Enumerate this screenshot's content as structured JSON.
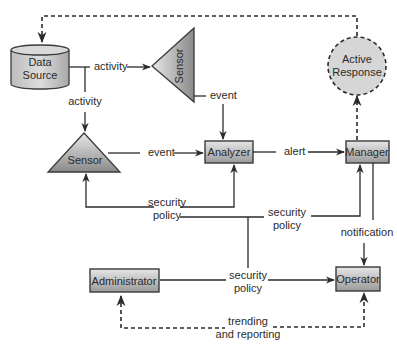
{
  "diagram": {
    "nodes": {
      "data_source": {
        "label_line1": "Data",
        "label_line2": "Source",
        "shape": "cylinder"
      },
      "sensor_top": {
        "label": "Sensor",
        "shape": "triangle-left"
      },
      "sensor_mid": {
        "label": "Sensor",
        "shape": "triangle-up"
      },
      "analyzer": {
        "label": "Analyzer",
        "shape": "box"
      },
      "manager": {
        "label": "Manager",
        "shape": "box"
      },
      "active_response": {
        "label_line1": "Active",
        "label_line2": "Response",
        "shape": "dashed-circle"
      },
      "administrator": {
        "label": "Administrator",
        "shape": "box"
      },
      "operator": {
        "label": "Operator",
        "shape": "box"
      }
    },
    "edges": {
      "ds_to_sensor_top": {
        "label": "activity"
      },
      "ds_to_sensor_mid": {
        "label": "activity"
      },
      "sensor_top_to_analyzer": {
        "label": "event"
      },
      "sensor_mid_to_analyzer": {
        "label": "event"
      },
      "analyzer_to_manager": {
        "label": "alert"
      },
      "policy_to_sensor_analyzer": {
        "label_line1": "security",
        "label_line2": "policy"
      },
      "policy_to_manager": {
        "label_line1": "security",
        "label_line2": "policy"
      },
      "admin_to_operator": {
        "label_line1": "security",
        "label_line2": "policy"
      },
      "manager_to_operator": {
        "label": "notification"
      },
      "trending": {
        "label_line1": "trending",
        "label_line2": "and reporting"
      }
    },
    "colors": {
      "node_fill_light": "#e4e4e4",
      "node_fill_dark": "#8e8e8e",
      "line": "#2b2b2b",
      "active_response_fill": "#d6d6d6"
    }
  }
}
